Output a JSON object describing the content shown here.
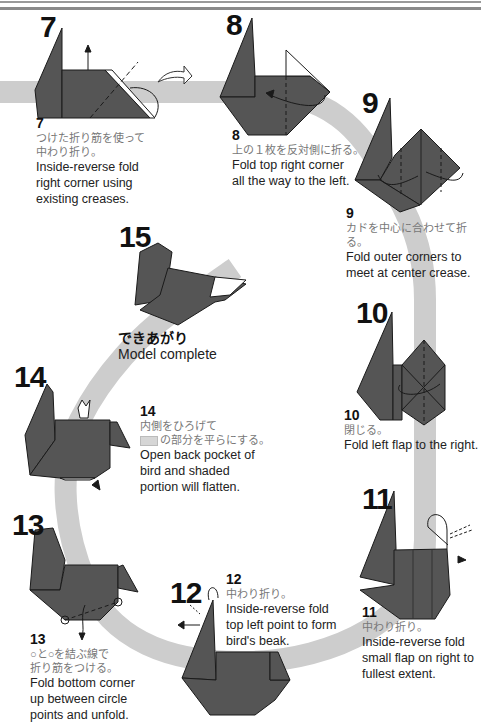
{
  "colors": {
    "paper": "#555555",
    "paper_edge": "#1a1a1a",
    "band": "#cdcdcd",
    "text_jp": "#777777",
    "text_en": "#222222"
  },
  "steps": [
    {
      "id": "7",
      "number": "7",
      "jp": "つけた折り筋を使って\n中わり折り。",
      "jp1": "つけた折り筋を使って",
      "jp2": "中わり折り。",
      "en1": "Inside-reverse fold",
      "en2": "right corner using",
      "en3": "existing creases."
    },
    {
      "id": "8",
      "number": "8",
      "jp1": "上の１枚を反対側に折る。",
      "en1": "Fold top right corner",
      "en2": "all the way to the left."
    },
    {
      "id": "9",
      "number": "9",
      "jp1": "カドを中心に合わせて折る。",
      "en1": "Fold outer corners to",
      "en2": "meet at center crease."
    },
    {
      "id": "10",
      "number": "10",
      "jp1": "閉じる。",
      "en1": "Fold left flap to the right."
    },
    {
      "id": "11",
      "number": "11",
      "jp1": "中わり折り。",
      "en1": "Inside-reverse fold",
      "en2": "small flap on right to",
      "en3": "fullest extent."
    },
    {
      "id": "12",
      "number": "12",
      "jp1": "中わり折り。",
      "en1": "Inside-reverse fold",
      "en2": "top left point to form",
      "en3": "bird's beak."
    },
    {
      "id": "13",
      "number": "13",
      "jp1": "○と○を結ぶ線で",
      "jp2": "折り筋をつける。",
      "en1": "Fold bottom corner",
      "en2": "up between circle",
      "en3": "points and unfold."
    },
    {
      "id": "14",
      "number": "14",
      "jp1": "内側をひろげて",
      "jp2": "の部分を平らにする。",
      "en1": "Open back pocket of",
      "en2": "bird and shaded",
      "en3": "portion will flatten."
    },
    {
      "id": "15",
      "number": "15",
      "jp1": "できあがり",
      "en1": "Model complete"
    }
  ],
  "icons": [
    "turn-over-arrow-icon",
    "fold-arrow-icon",
    "crease-line-icon",
    "push-arrow-icon"
  ]
}
